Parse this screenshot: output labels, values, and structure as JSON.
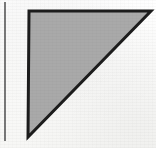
{
  "figure": {
    "caption": "",
    "canvas": {
      "width": 156,
      "height": 148
    },
    "background_color": "#fdfdfc",
    "shapes": [
      {
        "name": "right-triangle",
        "type": "polygon",
        "description": "right triangle, right angle at upper-left, hypotenuse from upper-right to lower-left",
        "fill_color": "#a9a9a9",
        "stroke_color": "#1c1c1c",
        "stroke_width": 3,
        "points": "29,11 151,11 28,137"
      },
      {
        "name": "left-margin-rule",
        "type": "line",
        "description": "faint vertical rule near left edge of the scanned page",
        "stroke_color": "#555555",
        "stroke_width": 2,
        "x1": 5,
        "y1": 2,
        "x2": 5,
        "y2": 141
      }
    ],
    "labels": []
  },
  "chart_data": {
    "type": "diagram",
    "title": "",
    "subtitle": "",
    "xlabel": "",
    "ylabel": "",
    "grid": false,
    "legend": null,
    "annotations": [],
    "elements": [
      {
        "id": "triangle-1",
        "shape": "right triangle",
        "vertices": [
          [
            29,
            11
          ],
          [
            151,
            11
          ],
          [
            28,
            137
          ]
        ],
        "fill": "#a9a9a9",
        "outline": "#1c1c1c",
        "leg_horizontal_length_px": 122,
        "leg_vertical_length_px": 126,
        "right_angle_at": [
          29,
          11
        ]
      },
      {
        "id": "rule-1",
        "shape": "vertical line",
        "from": [
          5,
          2
        ],
        "to": [
          5,
          141
        ],
        "stroke": "#555555"
      }
    ]
  }
}
